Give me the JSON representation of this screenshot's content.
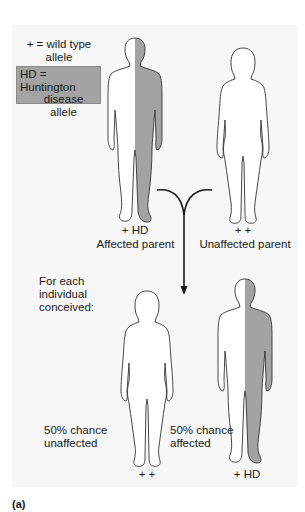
{
  "legend": {
    "wild_type": "+ = wild type allele",
    "wild_type_line1": "+ = wild type",
    "wild_type_line2": "allele",
    "hd_line1": "HD = Huntington",
    "hd_line2": "disease",
    "hd_line3": "allele",
    "hd_color": "#a3a3a3"
  },
  "parents": [
    {
      "genotype": "+ HD",
      "label": "Affected parent",
      "sex": "male",
      "affected": true
    },
    {
      "genotype": "+ +",
      "label": "Unaffected parent",
      "sex": "female",
      "affected": false
    }
  ],
  "offspring_heading": {
    "line1": "For each",
    "line2": "individual",
    "line3": "conceived:"
  },
  "offspring": [
    {
      "genotype": "+ +",
      "chance_line1": "50% chance",
      "chance_line2": "unaffected",
      "sex": "female",
      "affected": false
    },
    {
      "genotype": "+ HD",
      "chance_line1": "50% chance",
      "chance_line2": "affected",
      "sex": "male",
      "affected": true
    }
  ],
  "panel_label": "(a)",
  "colors": {
    "affected_fill": "#a3a3a3",
    "outline": "#333333",
    "panel_bg": "#f7f7f7"
  }
}
